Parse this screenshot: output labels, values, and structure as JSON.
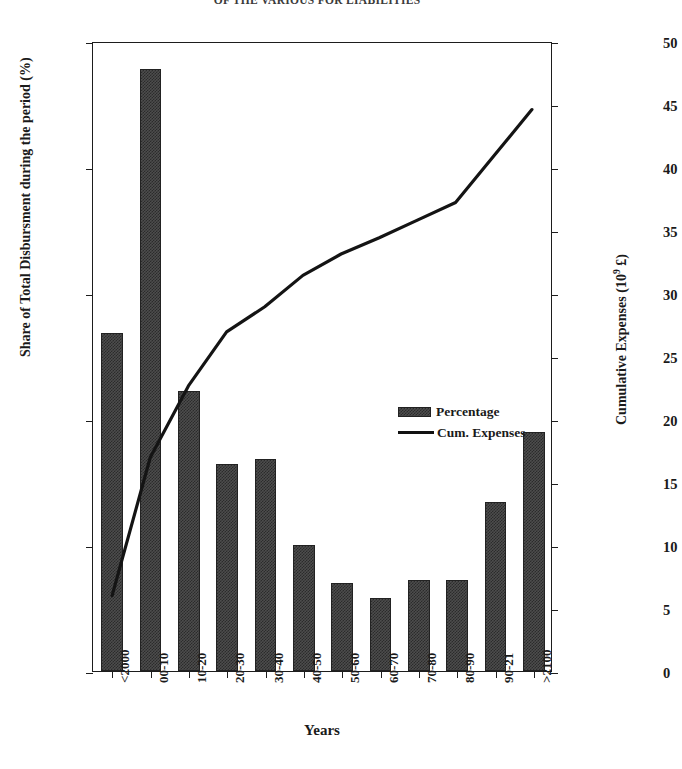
{
  "page_header": "OF THE VARIOUS FOR LIABILITIES",
  "chart_data": {
    "type": "bar",
    "title": "",
    "xlabel": "Years",
    "ylabel": "Share of Total Disbursment during the period (%)",
    "y2label": "Cumulative Expenses (10⁹ £)",
    "grid": false,
    "legend_position": "center",
    "ylim": [
      0,
      25
    ],
    "y2lim": [
      0,
      50
    ],
    "yticks": [
      "0",
      "5",
      "10",
      "15",
      "20",
      "25"
    ],
    "y2ticks": [
      "0",
      "5",
      "10",
      "15",
      "20",
      "25",
      "30",
      "35",
      "40",
      "45",
      "50"
    ],
    "categories": [
      "<2000",
      "00-10",
      "10-20",
      "20-30",
      "30-40",
      "40-50",
      "50-60",
      "60-70",
      "70-80",
      "80-90",
      "90-21",
      ">2100"
    ],
    "series": [
      {
        "name": "Percentage",
        "type": "bar",
        "axis": "left",
        "values": [
          13.4,
          23.9,
          11.1,
          8.2,
          8.4,
          5.0,
          3.5,
          2.9,
          3.6,
          3.6,
          6.7,
          9.5
        ]
      },
      {
        "name": "Cum. Expenses",
        "type": "line",
        "axis": "right",
        "values": [
          6.0,
          17.0,
          22.7,
          27.0,
          29.0,
          31.5,
          33.2,
          34.5,
          35.9,
          37.3,
          41.0,
          44.7
        ]
      }
    ]
  },
  "legend": {
    "items": [
      {
        "label": "Percentage",
        "swatch": "hatched-bar-swatch"
      },
      {
        "label": "Cum. Expenses",
        "swatch": "line-swatch"
      }
    ]
  },
  "axis_title_y2_parts": {
    "base": "Cumulative Expenses (10",
    "sup": "9",
    "tail": " £)"
  }
}
